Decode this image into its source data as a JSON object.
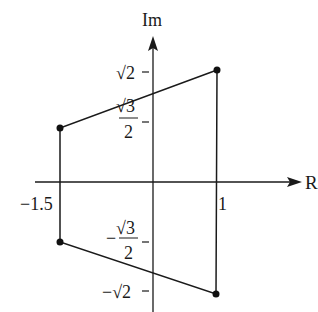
{
  "diagram": {
    "type": "complex-plane-quadrilateral",
    "axes": {
      "x_label": "R",
      "y_label": "Im",
      "x_ticks": [
        {
          "label": "−1.5",
          "value": -1.5
        },
        {
          "label": "1",
          "value": 1
        }
      ],
      "y_ticks": [
        {
          "label": "√2",
          "value": 1.414
        },
        {
          "label_num": "√3",
          "label_den": "2",
          "value": 0.866
        },
        {
          "label_prefix": "−",
          "label_num": "√3",
          "label_den": "2",
          "value": -0.866
        },
        {
          "label": "−√2",
          "value": -1.414
        }
      ]
    },
    "vertices": [
      {
        "name": "A",
        "x": 1,
        "y": "√2"
      },
      {
        "name": "B",
        "x": -1.5,
        "y": "√3/2"
      },
      {
        "name": "C",
        "x": -1.5,
        "y": "−√3/2"
      },
      {
        "name": "D",
        "x": 1,
        "y": "−√2"
      }
    ],
    "colors": {
      "line": "#1a1a1a",
      "background": "#ffffff"
    }
  }
}
